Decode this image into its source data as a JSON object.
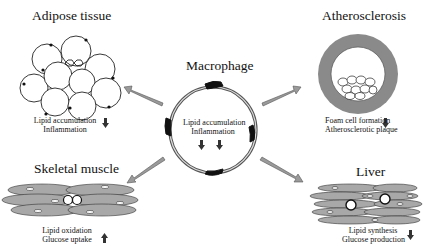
{
  "diagram": {
    "center": {
      "title": "Macrophage",
      "effects": [
        "Lipid accumulation",
        "Inflammation"
      ],
      "effect_direction": "down-down"
    },
    "panels": [
      {
        "id": "adipose",
        "title": "Adipose tissue",
        "effects": [
          "Lipid accumulation",
          "Inflammation"
        ],
        "direction": "down"
      },
      {
        "id": "atherosclerosis",
        "title": "Atherosclerosis",
        "effects": [
          "Foam cell formation",
          "Atherosclerotic plaque"
        ],
        "direction": "down"
      },
      {
        "id": "skeletal",
        "title": "Skeletal muscle",
        "effects": [
          "Lipid oxidation",
          "Glucose uptake"
        ],
        "direction": "up"
      },
      {
        "id": "liver",
        "title": "Liver",
        "effects": [
          "Lipid synthesis",
          "Glucose production"
        ],
        "direction": "down"
      }
    ],
    "colors": {
      "arrow_fill": "#9a9a9a",
      "ring_gray": "#8a8a8a",
      "muscle_fill": "#a8a8a8",
      "dark": "#111111"
    }
  }
}
